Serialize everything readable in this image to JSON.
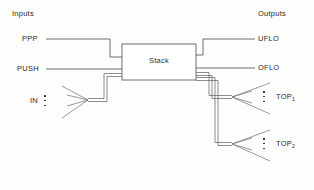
{
  "diagram": {
    "title_left": "Inputs",
    "title_right": "Outputs",
    "block": {
      "label": "Stack",
      "x": 122,
      "y": 44,
      "w": 74,
      "h": 36
    },
    "inputs": [
      {
        "name": "ppp",
        "label": "PPP",
        "type": "scalar",
        "x": 22,
        "y": 36
      },
      {
        "name": "push",
        "label": "PUSH",
        "type": "scalar",
        "x": 17,
        "y": 66
      },
      {
        "name": "in",
        "label": "IN",
        "type": "bus",
        "x": 30,
        "y": 101
      }
    ],
    "outputs": [
      {
        "name": "uflo",
        "label": "UFLO",
        "type": "scalar",
        "x": 258,
        "y": 36
      },
      {
        "name": "oflo",
        "label": "OFLO",
        "type": "scalar",
        "x": 258,
        "y": 65
      },
      {
        "name": "top1",
        "label": "TOP",
        "subscript": "1",
        "type": "bus",
        "x": 276,
        "y": 97
      },
      {
        "name": "top2",
        "label": "TOP",
        "subscript": "2",
        "type": "bus",
        "x": 276,
        "y": 144
      }
    ],
    "colors": {
      "wire": "#4a4a4a",
      "bus": "#6e6e6e",
      "text": "#2b2b2b",
      "background": "#fdfdfc"
    }
  }
}
